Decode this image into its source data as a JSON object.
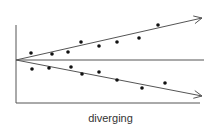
{
  "caption": "diverging",
  "colors": {
    "stroke": "#555555",
    "point": "#111111"
  },
  "diagram": {
    "axes": {
      "origin": [
        16,
        103
      ],
      "y_top": 25,
      "x_right": 200
    },
    "midline": {
      "from": [
        16,
        60
      ],
      "to": [
        204,
        60
      ]
    },
    "upper_trend": {
      "from": [
        16,
        60
      ],
      "to": [
        202,
        18
      ]
    },
    "lower_trend": {
      "from": [
        16,
        60
      ],
      "to": [
        202,
        96
      ]
    },
    "upper_points": [
      [
        31,
        53
      ],
      [
        52,
        54
      ],
      [
        68,
        52
      ],
      [
        81,
        42
      ],
      [
        99,
        46
      ],
      [
        117,
        42
      ],
      [
        139,
        38
      ],
      [
        158,
        25
      ]
    ],
    "lower_points": [
      [
        32,
        69
      ],
      [
        49,
        68
      ],
      [
        71,
        67
      ],
      [
        82,
        74
      ],
      [
        99,
        72
      ],
      [
        117,
        80
      ],
      [
        142,
        88
      ],
      [
        165,
        83
      ]
    ]
  }
}
